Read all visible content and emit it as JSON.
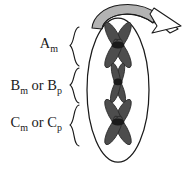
{
  "figure": {
    "background_color": "#ffffff",
    "width": 184,
    "height": 169
  },
  "cell": {
    "name": "cell-outline",
    "shape": "ellipse",
    "fill": "#ffffff",
    "stroke": "#1a1a1a",
    "center_x": 118,
    "center_y": 90,
    "radius_x": 31,
    "radius_y": 72
  },
  "arrow": {
    "name": "curved-arrow",
    "direction": "right",
    "band_fill": "#b3b3b3",
    "head_fill": "#ffffff",
    "stroke": "#1a1a1a"
  },
  "chromosomes": [
    {
      "id": "chromosome-a",
      "shape": "X",
      "size": "large",
      "arm_fill": "#4d4d4d",
      "centromere_fill": "#1a1a1a",
      "center_x": 118,
      "center_y": 45,
      "arm_length": 16,
      "arm_width": 5.2,
      "spread": 30
    },
    {
      "id": "chromosome-b",
      "shape": "X",
      "size": "small",
      "arm_fill": "#4d4d4d",
      "centromere_fill": "#1a1a1a",
      "center_x": 118,
      "center_y": 83,
      "arm_length": 13,
      "arm_width": 3.6,
      "spread": 16
    },
    {
      "id": "chromosome-c",
      "shape": "X",
      "size": "large",
      "arm_fill": "#4d4d4d",
      "centromere_fill": "#1a1a1a",
      "center_x": 118,
      "center_y": 122,
      "arm_length": 16,
      "arm_width": 5.2,
      "spread": 30
    }
  ],
  "labels": [
    {
      "id": "label-a",
      "base": "A",
      "subscript": "m",
      "tail": "",
      "tail_base": "",
      "tail_subscript": "",
      "full_text": "Am",
      "text_x": 58,
      "text_y": 48,
      "brace_top": 27,
      "brace_bottom": 66
    },
    {
      "id": "label-b",
      "base": "B",
      "subscript": "m",
      "tail": " or ",
      "tail_base": "B",
      "tail_subscript": "p",
      "full_text": "Bm or Bp",
      "text_x": 62,
      "text_y": 90,
      "brace_top": 68,
      "brace_bottom": 103
    },
    {
      "id": "label-c",
      "base": "C",
      "subscript": "m",
      "tail": " or ",
      "tail_base": "C",
      "tail_subscript": "p",
      "full_text": "Cm or Cp",
      "text_x": 62,
      "text_y": 127,
      "brace_top": 105,
      "brace_bottom": 146
    }
  ]
}
